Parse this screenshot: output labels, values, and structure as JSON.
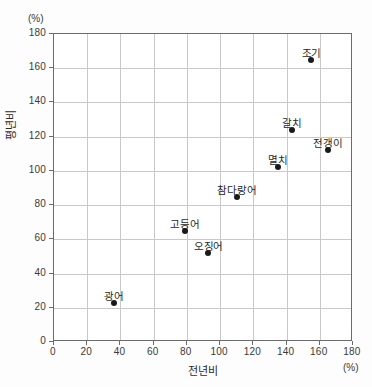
{
  "chart_data": {
    "type": "scatter",
    "title": "",
    "xlabel": "전년비",
    "ylabel": "평년비",
    "x_unit": "(%)",
    "y_unit": "(%)",
    "xlim": [
      0,
      180
    ],
    "ylim": [
      0,
      180
    ],
    "x_ticks": [
      0,
      20,
      40,
      60,
      80,
      100,
      120,
      140,
      160,
      180
    ],
    "y_ticks": [
      0,
      20,
      40,
      60,
      80,
      100,
      120,
      140,
      160,
      180
    ],
    "grid": true,
    "legend": "none",
    "point_color": "#1a1a1a",
    "grid_color": "#c9c9c9",
    "axis_color": "#6b6b6b",
    "points": [
      {
        "name": "광어",
        "x": 36,
        "y": 23,
        "label_dx": 0,
        "label_dy": -15
      },
      {
        "name": "고등어",
        "x": 79,
        "y": 65,
        "label_dx": 0,
        "label_dy": -15
      },
      {
        "name": "오징어",
        "x": 93,
        "y": 52,
        "label_dx": 0,
        "label_dy": -15
      },
      {
        "name": "참다랑어",
        "x": 110,
        "y": 85,
        "label_dx": 0,
        "label_dy": -15
      },
      {
        "name": "멸치",
        "x": 135,
        "y": 102,
        "label_dx": 0,
        "label_dy": -15
      },
      {
        "name": "갈치",
        "x": 143,
        "y": 124,
        "label_dx": 0,
        "label_dy": -15
      },
      {
        "name": "전갱이",
        "x": 165,
        "y": 112,
        "label_dx": 0,
        "label_dy": -15
      },
      {
        "name": "조기",
        "x": 155,
        "y": 165,
        "label_dx": 0,
        "label_dy": -15
      }
    ]
  }
}
